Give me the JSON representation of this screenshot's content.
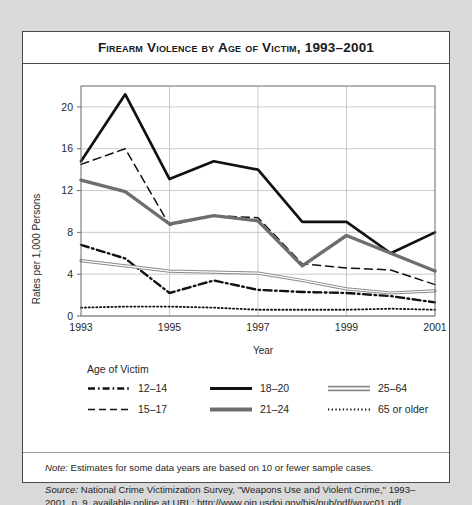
{
  "title": "Firearm Violence by Age of Victim, 1993–2001",
  "axes": {
    "xlabel": "Year",
    "ylabel": "Rates per 1,000 Persons",
    "xticks": [
      "1993",
      "1995",
      "1997",
      "1999",
      "2001"
    ],
    "yticks": [
      "0",
      "4",
      "8",
      "12",
      "16",
      "20"
    ]
  },
  "legend": {
    "title": "Age of Victim",
    "items": [
      {
        "label": "12–14",
        "style": "dash-dot",
        "color": "#111111"
      },
      {
        "label": "15–17",
        "style": "dashed",
        "color": "#111111"
      },
      {
        "label": "18–20",
        "style": "solid-thick",
        "color": "#111111"
      },
      {
        "label": "21–24",
        "style": "solid-thick-gray",
        "color": "#6e6e6e"
      },
      {
        "label": "25–64",
        "style": "double-line",
        "color": "#8a8a8a"
      },
      {
        "label": "65 or older",
        "style": "dotted",
        "color": "#111111"
      }
    ]
  },
  "notes": {
    "note_label": "Note:",
    "note_text": " Estimates for some data years are based on 10 or fewer sample cases.",
    "source_label": "Source:",
    "source_text": " National Crime Victimization Survey, \"Weapons Use and Violent Crime,\" 1993–2001, p. 9, available online at URL: http://www.ojp.usdoj.gov/bjs/pub/pdf/wuvc01.pdf."
  },
  "chart_data": {
    "type": "line",
    "title": "Firearm Violence by Age of Victim, 1993–2001",
    "xlabel": "Year",
    "ylabel": "Rates per 1,000 Persons",
    "x": [
      1993,
      1994,
      1995,
      1996,
      1997,
      1998,
      1999,
      2000,
      2001
    ],
    "xlim": [
      1993,
      2001
    ],
    "ylim": [
      0,
      22
    ],
    "grid": true,
    "legend_position": "below",
    "series": [
      {
        "name": "12–14",
        "style": "dash-dot",
        "color": "#111111",
        "values": [
          6.8,
          5.5,
          2.2,
          3.4,
          2.5,
          2.3,
          2.2,
          1.9,
          1.3
        ]
      },
      {
        "name": "15–17",
        "style": "dashed",
        "color": "#111111",
        "values": [
          14.5,
          16.0,
          8.7,
          9.6,
          9.4,
          5.0,
          4.6,
          4.4,
          3.0
        ]
      },
      {
        "name": "18–20",
        "style": "solid-thick",
        "color": "#111111",
        "values": [
          14.8,
          21.2,
          13.1,
          14.8,
          14.0,
          9.0,
          9.0,
          6.0,
          8.0
        ]
      },
      {
        "name": "21–24",
        "style": "solid-thick-gray",
        "color": "#6e6e6e",
        "values": [
          13.0,
          11.9,
          8.8,
          9.6,
          9.1,
          4.8,
          7.7,
          6.0,
          4.3
        ]
      },
      {
        "name": "25–64",
        "style": "double-line",
        "color": "#8a8a8a",
        "values": [
          5.3,
          4.8,
          4.3,
          4.2,
          4.1,
          3.4,
          2.6,
          2.2,
          2.4
        ]
      },
      {
        "name": "65 or older",
        "style": "dotted",
        "color": "#111111",
        "values": [
          0.8,
          0.9,
          0.9,
          0.8,
          0.6,
          0.6,
          0.6,
          0.7,
          0.6
        ]
      }
    ]
  }
}
